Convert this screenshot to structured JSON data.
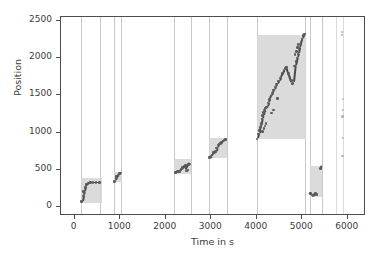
{
  "chart_data": {
    "type": "scatter",
    "title": "",
    "xlabel": "Time in s",
    "ylabel": "Position",
    "xlim": [
      -300,
      6400
    ],
    "ylim": [
      -120,
      2550
    ],
    "xticks": [
      0,
      1000,
      2000,
      3000,
      4000,
      5000,
      6000
    ],
    "xticklabels": [
      "0",
      "1000",
      "2000",
      "3000",
      "4000",
      "5000",
      "6000"
    ],
    "yticks": [
      0,
      500,
      1000,
      1500,
      2000,
      2500
    ],
    "yticklabels": [
      "0",
      "500",
      "1000",
      "1500",
      "2000",
      "2500"
    ],
    "grid": false,
    "legend": null,
    "colors": {
      "marker": "#4a4a4a",
      "shaded_region": "#d5d5d5",
      "vertical_line": "#c8c8cc",
      "axis": "#4d4d4d",
      "background": "#ffffff"
    },
    "vertical_lines": [
      140,
      560,
      860,
      1020,
      2190,
      2550,
      2950,
      3340,
      4000,
      5050,
      5160,
      5430,
      5750,
      5900
    ],
    "shaded_regions": [
      {
        "x0": 140,
        "x1": 600,
        "y0": 60,
        "y1": 390
      },
      {
        "x0": 860,
        "x1": 1030,
        "y0": 340,
        "y1": 465
      },
      {
        "x0": 2190,
        "x1": 2560,
        "y0": 450,
        "y1": 640
      },
      {
        "x0": 2950,
        "x1": 3340,
        "y0": 660,
        "y1": 920
      },
      {
        "x0": 4000,
        "x1": 5080,
        "y0": 910,
        "y1": 2310
      },
      {
        "x0": 5160,
        "x1": 5430,
        "y0": 140,
        "y1": 545
      }
    ],
    "series": [
      {
        "name": "run-1",
        "points": [
          [
            155,
            75
          ],
          [
            180,
            150
          ],
          [
            200,
            205
          ],
          [
            225,
            265
          ],
          [
            250,
            300
          ],
          [
            300,
            320
          ],
          [
            345,
            330
          ],
          [
            400,
            330
          ],
          [
            470,
            330
          ],
          [
            540,
            330
          ]
        ]
      },
      {
        "name": "run-2",
        "points": [
          [
            880,
            345
          ],
          [
            905,
            390
          ],
          [
            925,
            410
          ],
          [
            950,
            430
          ],
          [
            985,
            450
          ],
          [
            1010,
            455
          ]
        ]
      },
      {
        "name": "run-3",
        "points": [
          [
            2215,
            460
          ],
          [
            2260,
            475
          ],
          [
            2300,
            480
          ],
          [
            2340,
            500
          ],
          [
            2370,
            530
          ],
          [
            2400,
            545
          ],
          [
            2440,
            555
          ],
          [
            2470,
            565
          ],
          [
            2500,
            570
          ],
          [
            2530,
            575
          ],
          [
            2455,
            485
          ],
          [
            2490,
            495
          ]
        ]
      },
      {
        "name": "run-4",
        "points": [
          [
            2965,
            665
          ],
          [
            2995,
            680
          ],
          [
            3020,
            700
          ],
          [
            3050,
            730
          ],
          [
            3075,
            740
          ],
          [
            3100,
            745
          ],
          [
            3120,
            790
          ],
          [
            3150,
            830
          ],
          [
            3175,
            845
          ],
          [
            3200,
            855
          ],
          [
            3230,
            870
          ],
          [
            3260,
            885
          ],
          [
            3290,
            900
          ],
          [
            3320,
            910
          ]
        ]
      },
      {
        "name": "run-5",
        "points": [
          [
            4010,
            915
          ],
          [
            4040,
            980
          ],
          [
            4060,
            1025
          ],
          [
            4080,
            1075
          ],
          [
            4100,
            1120
          ],
          [
            4115,
            1180
          ],
          [
            4130,
            1225
          ],
          [
            4150,
            1270
          ],
          [
            4170,
            1300
          ],
          [
            4195,
            1330
          ],
          [
            4220,
            1345
          ],
          [
            4250,
            1395
          ],
          [
            4280,
            1445
          ],
          [
            4310,
            1490
          ],
          [
            4340,
            1530
          ],
          [
            4370,
            1570
          ],
          [
            4400,
            1610
          ],
          [
            4440,
            1650
          ],
          [
            4480,
            1690
          ],
          [
            4520,
            1730
          ],
          [
            4560,
            1790
          ],
          [
            4600,
            1840
          ],
          [
            4630,
            1865
          ],
          [
            4660,
            1880
          ],
          [
            4700,
            1790
          ],
          [
            4730,
            1745
          ],
          [
            4760,
            1700
          ],
          [
            4790,
            1660
          ],
          [
            4830,
            1890
          ],
          [
            4860,
            1950
          ],
          [
            4880,
            2000
          ],
          [
            4905,
            2055
          ],
          [
            4930,
            2130
          ],
          [
            4960,
            2190
          ],
          [
            4990,
            2250
          ],
          [
            5020,
            2300
          ],
          [
            5050,
            2320
          ]
        ]
      },
      {
        "name": "run-5-outliers",
        "points": [
          [
            4130,
            1010
          ],
          [
            4160,
            1055
          ],
          [
            4180,
            1090
          ],
          [
            4200,
            1120
          ],
          [
            4320,
            1260
          ],
          [
            4370,
            1300
          ],
          [
            4450,
            1455
          ],
          [
            4840,
            2045
          ],
          [
            4870,
            2090
          ],
          [
            4900,
            2140
          ],
          [
            4910,
            2180
          ]
        ]
      },
      {
        "name": "run-6",
        "points": [
          [
            5180,
            185
          ],
          [
            5210,
            160
          ],
          [
            5240,
            155
          ],
          [
            5265,
            165
          ],
          [
            5290,
            180
          ],
          [
            5320,
            170
          ],
          [
            5400,
            520
          ],
          [
            5415,
            540
          ]
        ]
      },
      {
        "name": "sparse-tail",
        "points": [
          [
            5880,
            2350
          ],
          [
            5880,
            2310
          ],
          [
            5890,
            1445
          ],
          [
            5890,
            1300
          ],
          [
            5885,
            1215
          ],
          [
            5890,
            930
          ],
          [
            5885,
            690
          ]
        ]
      }
    ]
  }
}
